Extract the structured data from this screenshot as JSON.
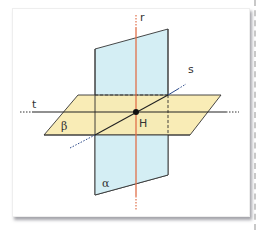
{
  "figure": {
    "labels": {
      "r": "r",
      "s": "s",
      "t": "t",
      "beta": "β",
      "alpha": "α",
      "H": "H"
    },
    "colors": {
      "plane_alpha_fill": "#d4eef4",
      "plane_beta_fill": "#f8eab0",
      "line_r": "#e0704a",
      "line_s": "#2c3e6a",
      "line_t": "#222222",
      "outline": "#333333",
      "point_H": "#111111"
    }
  }
}
